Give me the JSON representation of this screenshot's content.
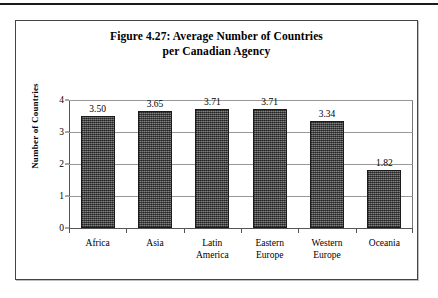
{
  "page": {
    "rule_present": true
  },
  "chart_data": {
    "type": "bar",
    "title": "Figure 4.27: Average Number of Countries per Canadian Agency",
    "title_line1": "Figure 4.27: Average Number of Countries",
    "title_line2": "per Canadian Agency",
    "xlabel": "",
    "ylabel": "Number of Countries",
    "ylim": [
      0,
      4
    ],
    "yticks": [
      0,
      1,
      2,
      3,
      4
    ],
    "ytick_labels": [
      "0",
      "1",
      "2",
      "3",
      "4"
    ],
    "grid": true,
    "legend": null,
    "categories": [
      "Africa",
      "Asia",
      "Latin America",
      "Eastern Europe",
      "Western Europe",
      "Oceania"
    ],
    "category_lines": [
      [
        "Africa",
        ""
      ],
      [
        "Asia",
        ""
      ],
      [
        "Latin",
        "America"
      ],
      [
        "Eastern",
        "Europe"
      ],
      [
        "Western",
        "Europe"
      ],
      [
        "Oceania",
        ""
      ]
    ],
    "values": [
      3.5,
      3.65,
      3.71,
      3.71,
      3.34,
      1.82
    ],
    "value_labels": [
      "3.50",
      "3.65",
      "3.71",
      "3.71",
      "3.34",
      "1.82"
    ],
    "bar_color": "#5a5a5a",
    "bar_border_color": "#1b1b1b",
    "gridline_color": "#999999",
    "axis_color": "#555555",
    "background_color": "#ffffff"
  }
}
